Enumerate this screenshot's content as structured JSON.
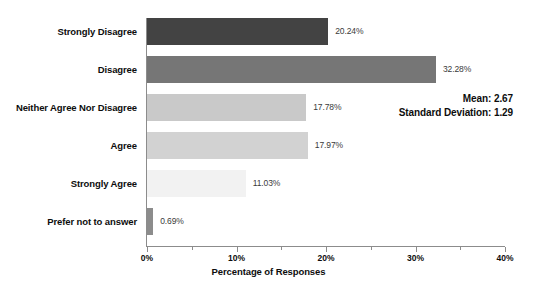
{
  "chart_data": {
    "type": "bar",
    "orientation": "horizontal",
    "title": "",
    "xlabel": "Percentage of Responses",
    "ylabel": "",
    "xlim": [
      0,
      40
    ],
    "xunit": "%",
    "grid": false,
    "legend": false,
    "categories": [
      "Strongly Disagree",
      "Disagree",
      "Neither Agree Nor Disagree",
      "Agree",
      "Strongly Agree",
      "Prefer not to answer"
    ],
    "values": [
      20.24,
      32.28,
      17.78,
      17.97,
      11.03,
      0.69
    ],
    "data_labels": [
      "20.24%",
      "32.28%",
      "17.78%",
      "17.97%",
      "11.03%",
      "0.69%"
    ],
    "bar_colors": [
      "#434343",
      "#767676",
      "#c9c9c9",
      "#d2d2d2",
      "#f2f2f2",
      "#8c8c8c"
    ],
    "xticks": [
      0,
      10,
      20,
      30,
      40
    ],
    "xtick_labels": [
      "0%",
      "10%",
      "20%",
      "30%",
      "40%"
    ],
    "minor_xticks": [
      5,
      15,
      25,
      35
    ],
    "annotations": {
      "mean_label": "Mean: 2.67",
      "std_label": "Standard Deviation: 1.29"
    }
  },
  "axis": {
    "line_color": "#8c8c8c"
  }
}
